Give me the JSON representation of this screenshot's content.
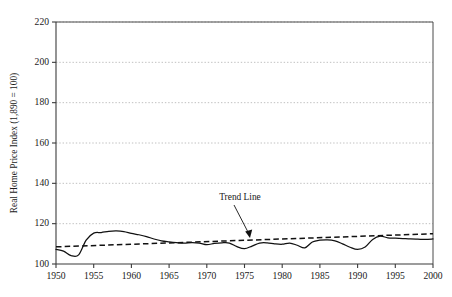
{
  "chart_data": {
    "type": "line",
    "title": "",
    "xlabel": "",
    "ylabel": "Real Home Price Index (1,890 = 100)",
    "xlim": [
      1950,
      2000
    ],
    "ylim": [
      100,
      220
    ],
    "grid": true,
    "legend": "none",
    "x_ticks": [
      1950,
      1955,
      1960,
      1965,
      1970,
      1975,
      1980,
      1985,
      1990,
      1995,
      2000
    ],
    "y_ticks": [
      100,
      120,
      140,
      160,
      180,
      200,
      220
    ],
    "annotations": [
      {
        "text": "Trend Line",
        "x": 1974,
        "y": 132,
        "points_to_x": 1976,
        "points_to_y": 114
      }
    ],
    "series": [
      {
        "name": "Real Home Price Index",
        "style": "solid",
        "x": [
          1950,
          1951,
          1952,
          1953,
          1954,
          1955,
          1956,
          1957,
          1958,
          1959,
          1960,
          1961,
          1962,
          1963,
          1964,
          1965,
          1966,
          1967,
          1968,
          1969,
          1970,
          1971,
          1972,
          1973,
          1974,
          1975,
          1976,
          1977,
          1978,
          1979,
          1980,
          1981,
          1982,
          1983,
          1984,
          1985,
          1986,
          1987,
          1988,
          1989,
          1990,
          1991,
          1992,
          1993,
          1994,
          1995,
          1996,
          1997,
          1998,
          1999,
          2000
        ],
        "values": [
          107.3,
          106.4,
          104.2,
          104.5,
          111.8,
          115.3,
          115.6,
          116.2,
          116.4,
          116.1,
          115.2,
          114.5,
          113.6,
          112.4,
          111.5,
          111.0,
          110.6,
          110.3,
          110.6,
          110.4,
          109.6,
          110.2,
          110.5,
          110.4,
          108.6,
          107.6,
          108.9,
          110.4,
          110.5,
          110.0,
          109.8,
          110.4,
          109.3,
          108.0,
          110.9,
          111.8,
          112.0,
          111.5,
          110.0,
          108.3,
          107.2,
          108.4,
          112.2,
          113.8,
          113.0,
          112.8,
          112.6,
          112.4,
          112.3,
          112.2,
          112.4
        ]
      },
      {
        "name": "Trend Line",
        "style": "dashed",
        "x": [
          1950,
          2000
        ],
        "values": [
          108.5,
          115.0
        ]
      }
    ]
  },
  "figure": {
    "caption": ""
  }
}
